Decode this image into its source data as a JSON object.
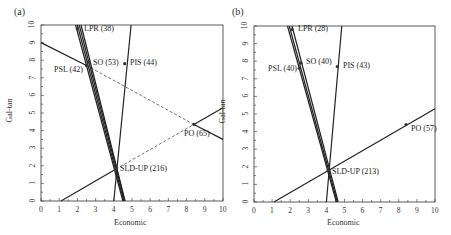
{
  "chart_data": [
    {
      "type": "line",
      "panel": "(a)",
      "xlabel": "Economic",
      "ylabel": "Gal-tan",
      "xlim": [
        0,
        10
      ],
      "ylim": [
        0,
        10
      ],
      "xticks": [
        "0",
        "1",
        "2",
        "3",
        "4",
        "5",
        "6",
        "7",
        "8",
        "9",
        "10"
      ],
      "yticks": [
        "0",
        "1",
        "2",
        "3",
        "4",
        "5",
        "6",
        "7",
        "8",
        "9",
        "10"
      ],
      "grid": false,
      "points": [
        {
          "label": "LPR (38)",
          "x": 2.0,
          "y": 9.8
        },
        {
          "label": "SO (53)",
          "x": 2.6,
          "y": 7.9
        },
        {
          "label": "PSL (42)",
          "x": 2.5,
          "y": 7.7
        },
        {
          "label": "PIS (44)",
          "x": 4.6,
          "y": 7.8
        },
        {
          "label": "PO (65)",
          "x": 8.4,
          "y": 4.35
        },
        {
          "label": "SLD-UP (216)",
          "x": 4.1,
          "y": 1.8
        }
      ],
      "lines": [
        {
          "style": "solid",
          "from": [
            0,
            9.0
          ],
          "to": [
            2.5,
            7.7
          ]
        },
        {
          "style": "dashed",
          "from": [
            2.5,
            7.7
          ],
          "to": [
            8.4,
            4.35
          ]
        },
        {
          "style": "solid",
          "from": [
            8.4,
            4.35
          ],
          "to": [
            10,
            3.5
          ]
        },
        {
          "style": "solid",
          "from": [
            1.1,
            0
          ],
          "to": [
            4.1,
            1.8
          ]
        },
        {
          "style": "dashed",
          "from": [
            4.1,
            1.8
          ],
          "to": [
            8.4,
            4.35
          ]
        },
        {
          "style": "solid",
          "from": [
            8.4,
            4.35
          ],
          "to": [
            10,
            5.3
          ]
        },
        {
          "style": "solid",
          "from": [
            1.9,
            10
          ],
          "to": [
            4.5,
            0
          ]
        },
        {
          "style": "solid",
          "from": [
            2.0,
            10
          ],
          "to": [
            4.55,
            0
          ]
        },
        {
          "style": "solid",
          "from": [
            2.1,
            10
          ],
          "to": [
            4.6,
            0
          ]
        },
        {
          "style": "solid",
          "from": [
            2.2,
            10
          ],
          "to": [
            4.62,
            0
          ]
        },
        {
          "style": "solid",
          "from": [
            4.95,
            10
          ],
          "to": [
            4.0,
            0
          ]
        }
      ]
    },
    {
      "type": "line",
      "panel": "(b)",
      "xlabel": "Economic",
      "ylabel": "Gal-tan",
      "xlim": [
        0,
        10
      ],
      "ylim": [
        0,
        10
      ],
      "xticks": [
        "0",
        "1",
        "2",
        "3",
        "4",
        "5",
        "6",
        "7",
        "8",
        "9",
        "10"
      ],
      "yticks": [
        "0",
        "1",
        "2",
        "3",
        "4",
        "5",
        "6",
        "7",
        "8",
        "9",
        "10"
      ],
      "grid": false,
      "points": [
        {
          "label": "LPR (28)",
          "x": 2.1,
          "y": 9.8
        },
        {
          "label": "SO (40)",
          "x": 2.6,
          "y": 7.9
        },
        {
          "label": "PSL (40)",
          "x": 2.5,
          "y": 7.6
        },
        {
          "label": "PIS (43)",
          "x": 4.6,
          "y": 7.7
        },
        {
          "label": "PO (57)",
          "x": 8.4,
          "y": 4.4
        },
        {
          "label": "SLD-UP (213)",
          "x": 4.1,
          "y": 1.8
        }
      ],
      "lines": [
        {
          "style": "solid",
          "from": [
            1.1,
            0
          ],
          "to": [
            10,
            5.3
          ]
        },
        {
          "style": "solid",
          "from": [
            1.85,
            10
          ],
          "to": [
            4.55,
            0
          ]
        },
        {
          "style": "solid",
          "from": [
            1.95,
            10
          ],
          "to": [
            4.6,
            0
          ]
        },
        {
          "style": "solid",
          "from": [
            2.1,
            10
          ],
          "to": [
            4.65,
            0
          ]
        },
        {
          "style": "solid",
          "from": [
            4.85,
            10
          ],
          "to": [
            4.0,
            0
          ]
        }
      ]
    }
  ],
  "panels": [
    {
      "letter": "(a)",
      "xlabel": "Economic",
      "ylabel": "Gal-tan",
      "labels": {
        "lpr": "LPR (38)",
        "so": "SO (53)",
        "psl": "PSL (42)",
        "pis": "PIS (44)",
        "po": "PO (65)",
        "sld": "SLD-UP (216)"
      }
    },
    {
      "letter": "(b)",
      "xlabel": "Economic",
      "ylabel": "Gal-tan",
      "labels": {
        "lpr": "LPR (28)",
        "so": "SO (40)",
        "psl": "PSL (40)",
        "pis": "PIS (43)",
        "po": "PO (57)",
        "sld": "SLD-UP (213)"
      }
    }
  ],
  "ticks": [
    "0",
    "1",
    "2",
    "3",
    "4",
    "5",
    "6",
    "7",
    "8",
    "9",
    "10"
  ]
}
